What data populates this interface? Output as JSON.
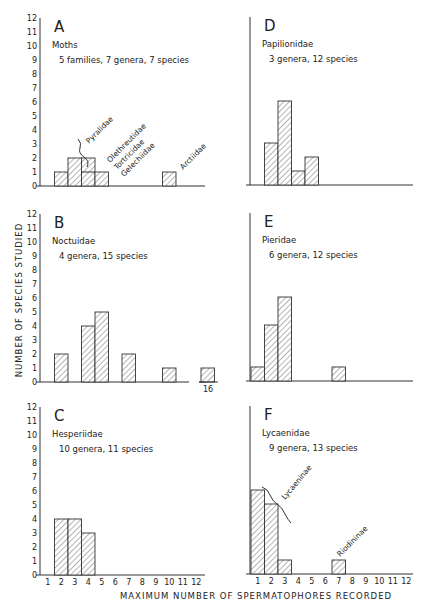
{
  "figure": {
    "ylabel": "NUMBER OF SPECIES STUDIED",
    "xlabel": "MAXIMUM NUMBER OF SPERMATOPHORES RECORDED",
    "x_ticks": [
      "1",
      "2",
      "3",
      "4",
      "5",
      "6",
      "7",
      "8",
      "9",
      "10",
      "11",
      "12"
    ],
    "y_ticks": [
      "0",
      "1",
      "2",
      "3",
      "4",
      "5",
      "6",
      "7",
      "8",
      "9",
      "10",
      "11",
      "12"
    ]
  },
  "chart_data": [
    {
      "type": "bar",
      "panel": "A",
      "title": "Moths",
      "subtitle": "5 families, 7 genera, 7 species",
      "categories": [
        1,
        2,
        3,
        4,
        5,
        6,
        7,
        8,
        9,
        10,
        11,
        12
      ],
      "values": [
        0,
        1,
        2,
        2,
        1,
        0,
        0,
        0,
        0,
        1,
        0,
        0
      ],
      "stacked_detail": [
        {
          "x": 3,
          "families": [
            "Pyralidae"
          ],
          "count": 2
        },
        {
          "x": 4,
          "families": [
            "Olethreutidae",
            "Tortricidae"
          ],
          "count": 2
        },
        {
          "x": 5,
          "families": [
            "Gelechiidae"
          ],
          "count": 1
        },
        {
          "x": 10,
          "families": [
            "Arctiidae"
          ],
          "count": 1
        }
      ],
      "annotations": [
        "Pyralidae",
        "Olethreutidae",
        "Tortricidae",
        "Gelechiidae",
        "Arctiidae"
      ],
      "xlabel": "",
      "ylabel": "",
      "ylim": [
        0,
        12
      ]
    },
    {
      "type": "bar",
      "panel": "B",
      "title": "Noctuidae",
      "subtitle": "4 genera, 15 species",
      "categories": [
        1,
        2,
        3,
        4,
        5,
        6,
        7,
        8,
        9,
        10,
        11,
        12,
        16
      ],
      "values": [
        0,
        2,
        0,
        4,
        5,
        0,
        2,
        0,
        0,
        1,
        0,
        0,
        1
      ],
      "annotations": [
        "16"
      ],
      "ylim": [
        0,
        12
      ]
    },
    {
      "type": "bar",
      "panel": "C",
      "title": "Hesperiidae",
      "subtitle": "10 genera, 11 species",
      "categories": [
        1,
        2,
        3,
        4,
        5,
        6,
        7,
        8,
        9,
        10,
        11,
        12
      ],
      "values": [
        0,
        4,
        4,
        3,
        0,
        0,
        0,
        0,
        0,
        0,
        0,
        0
      ],
      "ylim": [
        0,
        12
      ]
    },
    {
      "type": "bar",
      "panel": "D",
      "title": "Papilionidae",
      "subtitle": "3 genera, 12 species",
      "categories": [
        1,
        2,
        3,
        4,
        5,
        6,
        7,
        8,
        9,
        10,
        11,
        12
      ],
      "values": [
        0,
        3,
        6,
        1,
        2,
        0,
        0,
        0,
        0,
        0,
        0,
        0
      ],
      "ylim": [
        0,
        12
      ]
    },
    {
      "type": "bar",
      "panel": "E",
      "title": "Pieridae",
      "subtitle": "6 genera, 12 species",
      "categories": [
        1,
        2,
        3,
        4,
        5,
        6,
        7,
        8,
        9,
        10,
        11,
        12
      ],
      "values": [
        1,
        4,
        6,
        0,
        0,
        0,
        1,
        0,
        0,
        0,
        0,
        0
      ],
      "ylim": [
        0,
        12
      ]
    },
    {
      "type": "bar",
      "panel": "F",
      "title": "Lycaenidae",
      "subtitle": "9 genera, 13 species",
      "categories": [
        1,
        2,
        3,
        4,
        5,
        6,
        7,
        8,
        9,
        10,
        11,
        12
      ],
      "values": [
        6,
        5,
        1,
        0,
        0,
        0,
        1,
        0,
        0,
        0,
        0,
        0
      ],
      "annotations": [
        "Lycaeninae",
        "Riodininae"
      ],
      "ylim": [
        0,
        12
      ]
    }
  ],
  "panels": {
    "A": {
      "letter": "A",
      "family": "Moths",
      "subtitle": "5 families, 7 genera, 7 species",
      "labels": {
        "pyralidae": "Pyralidae",
        "olethreutidae": "Olethreutidae",
        "tortricidae": "Tortricidae",
        "gelechiidae": "Gelechiidae",
        "arctiidae": "Arctiidae"
      }
    },
    "B": {
      "letter": "B",
      "family": "Noctuidae",
      "subtitle": "4 genera, 15 species",
      "break_label": "16"
    },
    "C": {
      "letter": "C",
      "family": "Hesperiidae",
      "subtitle": "10 genera, 11 species"
    },
    "D": {
      "letter": "D",
      "family": "Papilionidae",
      "subtitle": "3 genera, 12 species"
    },
    "E": {
      "letter": "E",
      "family": "Pieridae",
      "subtitle": "6 genera, 12 species"
    },
    "F": {
      "letter": "F",
      "family": "Lycaenidae",
      "subtitle": "9 genera, 13 species",
      "labels": {
        "lycaeninae": "Lycaeninae",
        "riodininae": "Riodininae"
      }
    }
  }
}
